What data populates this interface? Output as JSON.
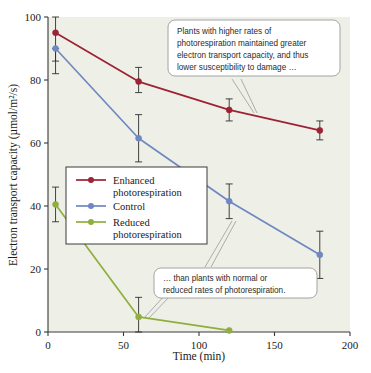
{
  "chart_data": {
    "type": "line",
    "title": "",
    "xlabel": "Time (min)",
    "ylabel": "Electron transport capacity (µmol/m²/s)",
    "xlim": [
      0,
      200
    ],
    "ylim": [
      0,
      100
    ],
    "xticks": [
      0,
      50,
      100,
      150,
      200
    ],
    "yticks": [
      0,
      20,
      40,
      60,
      80,
      100
    ],
    "grid": false,
    "legend_position": "center-left",
    "error_bars": "visible",
    "series": [
      {
        "name": "Enhanced photoresponse",
        "label": "Enhanced photorespiration",
        "color": "#9d2235",
        "x": [
          5,
          60,
          120,
          180
        ],
        "values": [
          95.0,
          79.5,
          70.5,
          64.0
        ],
        "err_low": [
          86.0,
          76.0,
          67.0,
          61.0
        ],
        "err_high": [
          100.0,
          84.0,
          74.0,
          67.0
        ]
      },
      {
        "name": "Control",
        "label": "Control",
        "color": "#6f88c2",
        "x": [
          5,
          60,
          120,
          180
        ],
        "values": [
          90.0,
          61.5,
          41.5,
          24.5
        ],
        "err_low": [
          82.0,
          54.0,
          36.0,
          17.0
        ],
        "err_high": [
          90.0,
          69.0,
          47.0,
          32.0
        ]
      },
      {
        "name": "Reduced photorespiration",
        "label": "Reduced photorespiration",
        "color": "#8fae3e",
        "x": [
          5,
          60,
          120
        ],
        "values": [
          40.5,
          4.8,
          0.5
        ],
        "err_low": [
          35.0,
          0.0,
          0.5
        ],
        "err_high": [
          46.0,
          11.0,
          0.5
        ]
      }
    ]
  },
  "axes": {
    "x_tick_labels": [
      "0",
      "50",
      "100",
      "150",
      "200"
    ],
    "y_tick_labels": [
      "0",
      "20",
      "40",
      "60",
      "80",
      "100"
    ],
    "x_axis_title": "Time (min)",
    "y_axis_title": "Electron transport capacity (µmol/m²/s)"
  },
  "legend": {
    "entries": [
      {
        "label_line1": "Enhanced",
        "label_line2": "photorespiration",
        "color": "#9d2235"
      },
      {
        "label_line1": "Control",
        "label_line2": "",
        "color": "#6f88c2"
      },
      {
        "label_line1": "Reduced",
        "label_line2": "photorespiration",
        "color": "#8fae3e"
      }
    ]
  },
  "callouts": [
    {
      "id": "callout-upper",
      "lines": [
        "Plants with higher rates of",
        "photorespiration maintained greater",
        "electron transport capacity, and thus",
        "lower susceptibility to damage …"
      ]
    },
    {
      "id": "callout-lower",
      "lines": [
        "… than plants with normal or",
        "reduced rates of photorespiration."
      ]
    }
  ],
  "colors": {
    "plot_background": "#eef0e7",
    "page_background": "#ffffff",
    "axis": "#3a3a3a",
    "enhanced": "#9d2235",
    "control": "#6f88c2",
    "reduced": "#8fae3e"
  }
}
